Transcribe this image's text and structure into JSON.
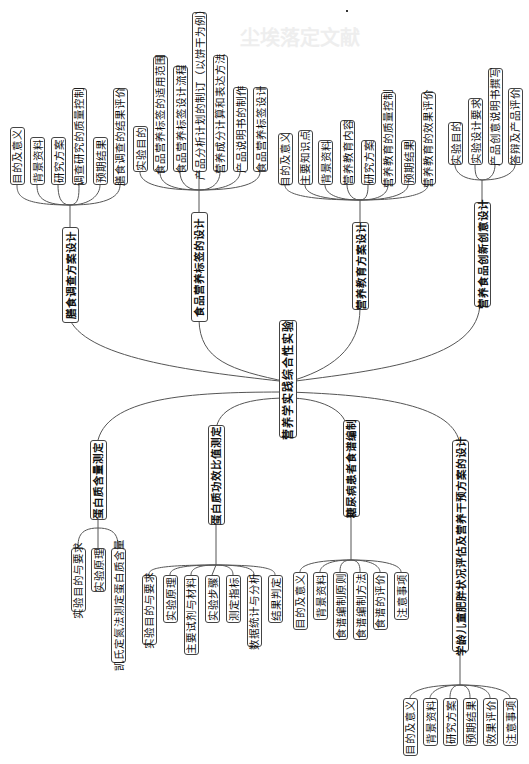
{
  "background_title": "尘埃落定文献",
  "central": {
    "label": "营养学实践综合性实验"
  },
  "branches": [
    {
      "label": "膳食调查方案设计",
      "children": [
        "目的及意义",
        "背景资料",
        "研究方案",
        "调查研究的质量控制",
        "预期结果",
        "膳食调查的结果评价"
      ]
    },
    {
      "label": "食品营养标签的设计",
      "children": [
        "实验目的",
        "食品营养标签的适用范围",
        "食品营养标签设计流程",
        "产品分析计划的制订（以饼干为例）",
        "营养成分计算和表达方法",
        "产品说明书的制作",
        "食品营养标签设计"
      ]
    },
    {
      "label": "营养教育方案设计",
      "children": [
        "目的及意义",
        "主要知识点",
        "背景资料",
        "营养教育内容",
        "研究方案",
        "营养教育的质量控制",
        "预期结果",
        "营养教育的效果评价"
      ]
    },
    {
      "label": "营养食品创新创意设计",
      "children": [
        "实验目的",
        "实验设计要求",
        "产品创意说明书撰写",
        "答辩及产品评价"
      ]
    },
    {
      "label": "蛋白质含量测定",
      "children": [
        "实验目的与要求",
        "实验原理",
        "凯氏定氮法测定蛋白质含量"
      ]
    },
    {
      "label": "蛋白质功效比值测定",
      "children": [
        "实验目的与要求",
        "实验原理",
        "主要试剂与材料",
        "实验步骤",
        "测定指标",
        "数据统计与分析",
        "结果判定"
      ]
    },
    {
      "label": "糖尿病患者食谱编制",
      "children": [
        "目的及意义",
        "背景资料",
        "食谱编制原则",
        "食谱编制方法",
        "食谱的评价",
        "注意事项"
      ]
    },
    {
      "label": "学龄儿童肥胖状况评估及营养干预方案的设计",
      "children": [
        "目的及意义",
        "背景资料",
        "研究方案",
        "预期结果",
        "效果评价",
        "注意事项"
      ]
    }
  ]
}
